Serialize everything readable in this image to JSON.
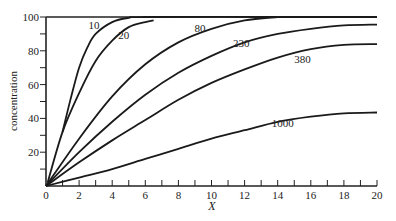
{
  "chart_data": {
    "type": "line",
    "title": "",
    "xlabel": "X",
    "ylabel": "concentration",
    "xlim": [
      0,
      20
    ],
    "ylim": [
      0,
      100
    ],
    "x_ticks": [
      0,
      2,
      4,
      6,
      8,
      10,
      12,
      14,
      16,
      18,
      20
    ],
    "y_ticks": [
      20,
      40,
      60,
      80,
      100
    ],
    "y_tick_labels": [
      "20",
      "40",
      "60",
      "80",
      "100"
    ],
    "x_tick_labels": [
      "0",
      "2",
      "4",
      "6",
      "8",
      "10",
      "12",
      "14",
      "16",
      "18",
      "20"
    ],
    "grid": false,
    "legend": "inline curve labels",
    "series": [
      {
        "name": "10",
        "points": [
          [
            1.0,
            32
          ],
          [
            1.5,
            52
          ],
          [
            2,
            70
          ],
          [
            2.5,
            82
          ],
          [
            3,
            90
          ],
          [
            4,
            97
          ],
          [
            5,
            99.5
          ],
          [
            6,
            100
          ],
          [
            14,
            100
          ],
          [
            20,
            100
          ]
        ]
      },
      {
        "name": "20",
        "points": [
          [
            0.1,
            2
          ],
          [
            1,
            32
          ],
          [
            2,
            55
          ],
          [
            3,
            74
          ],
          [
            4,
            86
          ],
          [
            5,
            94
          ],
          [
            6,
            97
          ],
          [
            6.5,
            98
          ]
        ]
      },
      {
        "name": "80",
        "points": [
          [
            0,
            0
          ],
          [
            2,
            28
          ],
          [
            4,
            53
          ],
          [
            6,
            72
          ],
          [
            8,
            85
          ],
          [
            10,
            93
          ],
          [
            12,
            98
          ],
          [
            14,
            100
          ]
        ]
      },
      {
        "name": "230",
        "points": [
          [
            0,
            0
          ],
          [
            2,
            20
          ],
          [
            4,
            38
          ],
          [
            6,
            54
          ],
          [
            8,
            67
          ],
          [
            10,
            77
          ],
          [
            12,
            85
          ],
          [
            14,
            90
          ],
          [
            16,
            93
          ],
          [
            18,
            95
          ],
          [
            20,
            95.5
          ]
        ]
      },
      {
        "name": "380",
        "points": [
          [
            0,
            0
          ],
          [
            2,
            14
          ],
          [
            4,
            27
          ],
          [
            6,
            39
          ],
          [
            8,
            51
          ],
          [
            10,
            61
          ],
          [
            12,
            69
          ],
          [
            14,
            76
          ],
          [
            16,
            81
          ],
          [
            18,
            83.5
          ],
          [
            20,
            84
          ]
        ]
      },
      {
        "name": "1000",
        "points": [
          [
            0,
            0
          ],
          [
            2,
            5
          ],
          [
            4,
            10
          ],
          [
            6,
            16
          ],
          [
            8,
            22
          ],
          [
            10,
            28
          ],
          [
            12,
            33
          ],
          [
            14,
            38
          ],
          [
            16,
            41
          ],
          [
            18,
            43
          ],
          [
            20,
            43.5
          ]
        ]
      }
    ],
    "labels": [
      {
        "text": "10",
        "x": 2.9,
        "y": 93
      },
      {
        "text": "20",
        "x": 4.7,
        "y": 87
      },
      {
        "text": "80",
        "x": 9.3,
        "y": 91
      },
      {
        "text": "230",
        "x": 11.8,
        "y": 82
      },
      {
        "text": "380",
        "x": 15.5,
        "y": 73
      },
      {
        "text": "1000",
        "x": 14.3,
        "y": 35
      }
    ]
  }
}
